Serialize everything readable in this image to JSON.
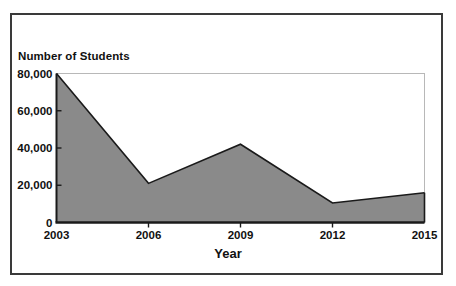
{
  "chart_data": {
    "type": "area",
    "title": "",
    "xlabel": "Year",
    "ylabel": "Number of Students",
    "categories": [
      "2003",
      "2006",
      "2009",
      "2012",
      "2015"
    ],
    "x": [
      2003,
      2006,
      2009,
      2012,
      2015
    ],
    "values": [
      80000,
      21000,
      42000,
      10500,
      16000
    ],
    "series": [
      {
        "name": "Number of Students",
        "values": [
          80000,
          21000,
          42000,
          10500,
          16000
        ]
      }
    ],
    "ylim": [
      0,
      80000
    ],
    "xlim": [
      2003,
      2015
    ],
    "yticks": [
      0,
      20000,
      40000,
      60000,
      80000
    ],
    "ytick_labels": [
      "0",
      "20,000",
      "40,000",
      "60,000",
      "80,000"
    ],
    "xticks": [
      2003,
      2006,
      2009,
      2012,
      2015
    ],
    "xtick_labels": [
      "2003",
      "2006",
      "2009",
      "2012",
      "2015"
    ],
    "grid": false,
    "legend": "none",
    "colors": {
      "area_fill": "#8a8a8a",
      "area_stroke": "#1a1a1a",
      "axis": "#1a1a1a",
      "plot_border": "#b8b8b8",
      "outer_border": "#3a3a3a",
      "text": "#111111",
      "background": "#ffffff"
    }
  },
  "labels": {
    "y_axis_title": "Number of Students",
    "x_axis_title": "Year"
  }
}
